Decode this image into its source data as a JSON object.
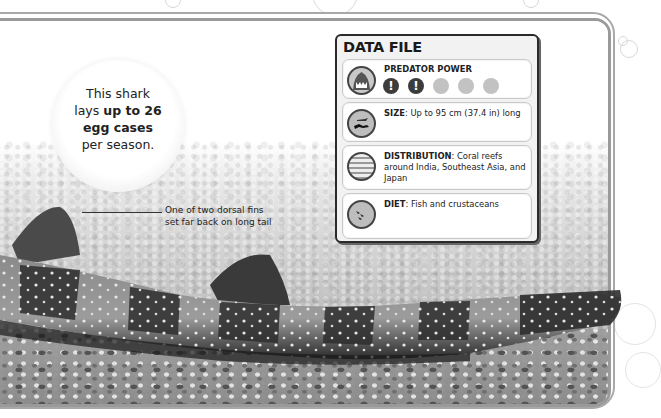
{
  "fact_bubble": {
    "line1": "This shark",
    "line2_prefix": "lays ",
    "line2_bold": "up to 26",
    "line3_bold": "egg cases",
    "line4": "per season."
  },
  "annotation": {
    "line1": "One of two dorsal fins",
    "line2": "set far back on long tail"
  },
  "data_file": {
    "title": "DATA FILE",
    "predator_power": {
      "label": "PREDATOR POWER",
      "icon": "shark-jaws-icon",
      "rating": 2,
      "max": 5,
      "marker": "!"
    },
    "size": {
      "icon": "diver-and-shark-size-icon",
      "key": "SIZE",
      "value": ": Up to 95 cm (37.4 in) long"
    },
    "distribution": {
      "icon": "ocean-waves-icon",
      "key": "DISTRIBUTION",
      "value": ": Coral reefs around India, Southeast Asia, and Japan"
    },
    "diet": {
      "icon": "fish-icon",
      "key": "DIET",
      "value": ": Fish and crustaceans"
    }
  },
  "colors": {
    "panel_border": "#2a2a2a",
    "dot_active": "#3c3c3c",
    "dot_inactive": "#c2c2c2",
    "frame": "#9a9a9a"
  }
}
